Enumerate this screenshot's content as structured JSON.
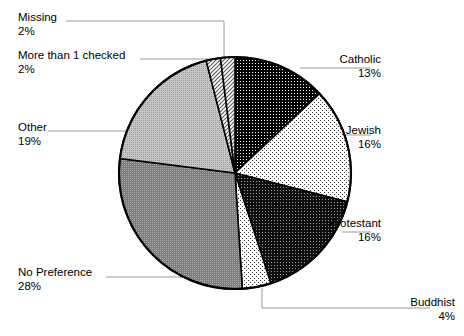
{
  "chart_data": {
    "type": "pie",
    "title": "",
    "xlabel": "",
    "ylabel": "",
    "legend_position": "callout-labels",
    "grid": false,
    "units": "percent",
    "total": 100,
    "start_angle_deg": 0,
    "direction": "clockwise",
    "categories": [
      "Catholic",
      "Jewish",
      "Protestant",
      "Buddhist",
      "No Preference",
      "Other",
      "More than 1 checked",
      "Missing"
    ],
    "values": [
      13,
      16,
      16,
      4,
      28,
      19,
      2,
      2
    ],
    "slices": [
      {
        "label": "Catholic",
        "value": 13,
        "percent_text": "13%",
        "fill": "dark-dots",
        "color": "#141414",
        "label_side": "right",
        "label_x": 381,
        "label_y": 52,
        "leader": [
          [
            300,
            68
          ],
          [
            371,
            68
          ]
        ]
      },
      {
        "label": "Jewish",
        "value": 16,
        "percent_text": "16%",
        "fill": "light-dots",
        "color": "#f2f2f2",
        "label_side": "right",
        "label_x": 381,
        "label_y": 123,
        "leader": [
          [
            345,
            135
          ],
          [
            371,
            135
          ]
        ]
      },
      {
        "label": "Protestant",
        "value": 16,
        "percent_text": "16%",
        "fill": "dark-crosshatch",
        "color": "#232323",
        "label_side": "right",
        "label_x": 381,
        "label_y": 216,
        "leader": [
          [
            342,
            232
          ],
          [
            371,
            232
          ]
        ]
      },
      {
        "label": "Buddhist",
        "value": 4,
        "percent_text": "4%",
        "fill": "light-dots",
        "color": "#f2f2f2",
        "label_side": "right",
        "label_x": 455,
        "label_y": 295,
        "leader": [
          [
            262,
            288
          ],
          [
            262,
            308
          ],
          [
            430,
            308
          ]
        ]
      },
      {
        "label": "No Preference",
        "value": 28,
        "percent_text": "28%",
        "fill": "mid-gray-dots",
        "color": "#8c8c8c",
        "label_side": "left",
        "label_x": 18,
        "label_y": 265,
        "leader": [
          [
            106,
            277
          ],
          [
            190,
            277
          ]
        ]
      },
      {
        "label": "Other",
        "value": 19,
        "percent_text": "19%",
        "fill": "light-gray-dots",
        "color": "#bdbdbd",
        "label_side": "left",
        "label_x": 18,
        "label_y": 120,
        "leader": [
          [
            48,
            131
          ],
          [
            128,
            131
          ]
        ]
      },
      {
        "label": "More than 1 checked",
        "value": 2,
        "percent_text": "2%",
        "fill": "diagonal-hatch",
        "color": "#d8d8d8",
        "label_side": "left",
        "label_x": 18,
        "label_y": 48,
        "leader": [
          [
            140,
            59
          ],
          [
            224,
            59
          ]
        ]
      },
      {
        "label": "Missing",
        "value": 2,
        "percent_text": "2%",
        "fill": "diagonal-hatch",
        "color": "#d8d8d8",
        "label_side": "left",
        "label_x": 18,
        "label_y": 10,
        "leader": [
          [
            66,
            21
          ],
          [
            224,
            21
          ],
          [
            224,
            60
          ]
        ]
      }
    ],
    "geometry": {
      "center_x": 235,
      "center_y": 173,
      "radius": 116,
      "outline_color": "#000000"
    }
  }
}
